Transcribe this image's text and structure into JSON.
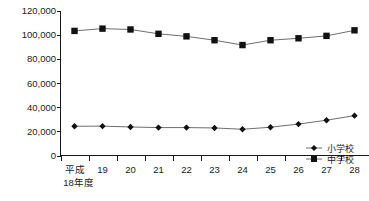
{
  "chart_data": {
    "type": "line",
    "title": "",
    "xlabel": "",
    "ylabel": "",
    "grid": false,
    "legend_position": "inside-bottom-right",
    "ylim": [
      0,
      120000
    ],
    "ytick_step": 20000,
    "ytick_labels": [
      "0",
      "20,000",
      "40,000",
      "60,000",
      "80,000",
      "100,000",
      "120,000"
    ],
    "ytick_values": [
      0,
      20000,
      40000,
      60000,
      80000,
      100000,
      120000
    ],
    "categories": [
      "平成",
      "19",
      "20",
      "21",
      "22",
      "23",
      "24",
      "25",
      "26",
      "27",
      "28"
    ],
    "category_sub_first": "18年度",
    "x_values": [
      18,
      19,
      20,
      21,
      22,
      23,
      24,
      25,
      26,
      27,
      28
    ],
    "series": [
      {
        "name": "小学校",
        "marker": "diamond",
        "values": [
          24200,
          24300,
          23600,
          23100,
          23100,
          22800,
          21700,
          23400,
          26000,
          29200,
          33000
        ]
      },
      {
        "name": "中学校",
        "marker": "square",
        "values": [
          103100,
          105000,
          104300,
          100700,
          98600,
          95400,
          91400,
          95400,
          97000,
          99000,
          103600
        ]
      }
    ]
  },
  "legend": {
    "items": [
      {
        "label": "小学校",
        "marker": "diamond"
      },
      {
        "label": "中学校",
        "marker": "square"
      }
    ]
  },
  "colors": {
    "marker": "#111111",
    "line": "#6e6e6e",
    "axis": "#1a1a1a",
    "background": "#ffffff"
  }
}
